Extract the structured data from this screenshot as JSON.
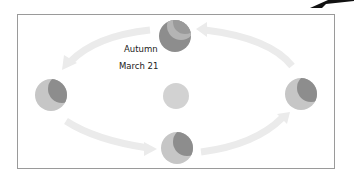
{
  "diagram": {
    "type": "earth-orbit-seasons",
    "labels": {
      "season": "Autumn",
      "date": "March 21"
    },
    "bodies": [
      {
        "name": "sun",
        "cx": 176,
        "cy": 96,
        "r": 13,
        "color": "#d2d2d2"
      },
      {
        "name": "earth-top",
        "cx": 175,
        "cy": 36,
        "r": 16
      },
      {
        "name": "earth-left",
        "cx": 51,
        "cy": 95,
        "r": 16
      },
      {
        "name": "earth-right",
        "cx": 301,
        "cy": 94,
        "r": 16
      },
      {
        "name": "earth-bottom",
        "cx": 177,
        "cy": 148,
        "r": 16
      }
    ],
    "colors": {
      "orbit_arrow": "#ebebeb",
      "earth_light": "#c6c6c6",
      "earth_dark": "#8d8d8d",
      "frame": "#9a9a9a"
    }
  }
}
